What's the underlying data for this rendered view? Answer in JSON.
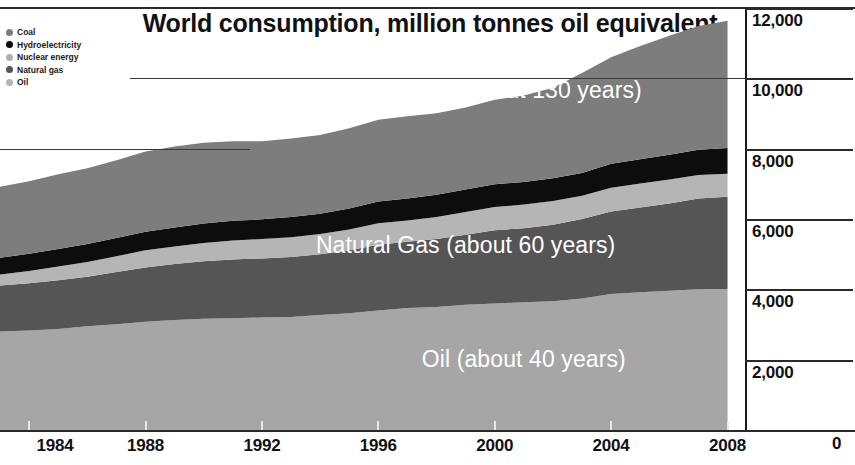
{
  "chart_data": {
    "type": "area",
    "title": "World consumption, million tonnes oil equivalent",
    "xlabel": "",
    "ylabel": "",
    "xlim": [
      1983,
      2008.6
    ],
    "ylim": [
      0,
      12000
    ],
    "grid": true,
    "stacked": true,
    "legend_position": "top-left",
    "x_ticks": [
      "1984",
      "1988",
      "1992",
      "1996",
      "2000",
      "2004",
      "2008"
    ],
    "x_tick_values": [
      1984,
      1988,
      1992,
      1996,
      2000,
      2004,
      2008
    ],
    "y_ticks": [
      "0",
      "2,000",
      "4,000",
      "6,000",
      "8,000",
      "10,000",
      "12,000"
    ],
    "y_tick_values": [
      0,
      2000,
      4000,
      6000,
      8000,
      10000,
      12000
    ],
    "x": [
      1983,
      1984,
      1985,
      1986,
      1987,
      1988,
      1989,
      1990,
      1991,
      1992,
      1993,
      1994,
      1995,
      1996,
      1997,
      1998,
      1999,
      2000,
      2001,
      2002,
      2003,
      2004,
      2005,
      2006,
      2007,
      2008
    ],
    "series": [
      {
        "name": "Oil",
        "color": "#a6a6a6",
        "values": [
          2800,
          2830,
          2870,
          2950,
          3010,
          3080,
          3130,
          3160,
          3180,
          3200,
          3210,
          3270,
          3320,
          3400,
          3470,
          3500,
          3560,
          3600,
          3630,
          3660,
          3740,
          3870,
          3920,
          3960,
          4000,
          4010
        ]
      },
      {
        "name": "Natural gas",
        "color": "#555555",
        "values": [
          1310,
          1340,
          1390,
          1410,
          1480,
          1540,
          1590,
          1640,
          1670,
          1680,
          1710,
          1730,
          1790,
          1870,
          1880,
          1930,
          1990,
          2080,
          2110,
          2180,
          2260,
          2340,
          2410,
          2480,
          2580,
          2620
        ]
      },
      {
        "name": "Nuclear energy",
        "color": "#b5b5b5",
        "values": [
          310,
          350,
          390,
          420,
          450,
          490,
          500,
          520,
          540,
          550,
          560,
          570,
          590,
          610,
          610,
          630,
          650,
          660,
          670,
          670,
          660,
          680,
          680,
          680,
          670,
          660
        ]
      },
      {
        "name": "Hydroelectricity",
        "color": "#0d0d0d",
        "values": [
          480,
          490,
          500,
          510,
          520,
          530,
          540,
          550,
          560,
          560,
          580,
          580,
          600,
          620,
          620,
          630,
          640,
          650,
          640,
          650,
          650,
          680,
          690,
          710,
          720,
          730
        ]
      },
      {
        "name": "Coal",
        "color": "#7d7d7d",
        "values": [
          2020,
          2060,
          2120,
          2150,
          2210,
          2280,
          2300,
          2300,
          2260,
          2220,
          2230,
          2240,
          2280,
          2320,
          2340,
          2320,
          2330,
          2400,
          2460,
          2570,
          2840,
          3030,
          3220,
          3380,
          3520,
          3620
        ]
      }
    ],
    "annotations": [
      {
        "text": "Coal   (about 130 years)",
        "x": 2001.0,
        "y": 9600
      },
      {
        "text": "Natural Gas   (about 60 years)",
        "x": 1999.0,
        "y": 5200
      },
      {
        "text": "Oil   (about 40 years)",
        "x": 2001.0,
        "y": 1950
      }
    ]
  },
  "legend": {
    "items": [
      {
        "label": "Coal",
        "color": "#7d7d7d"
      },
      {
        "label": "Hydroelectricity",
        "color": "#0d0d0d"
      },
      {
        "label": "Nuclear energy",
        "color": "#b0b0b0"
      },
      {
        "label": "Natural gas",
        "color": "#555555"
      },
      {
        "label": "Oil",
        "color": "#b5b5b5"
      }
    ]
  }
}
